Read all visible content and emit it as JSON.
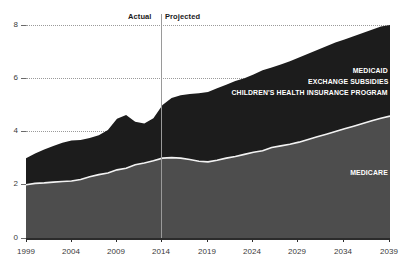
{
  "chart_data": {
    "type": "area",
    "stacked": true,
    "title": "",
    "subtitle": "",
    "xlabel": "",
    "ylabel": "",
    "xlim": [
      1999,
      2039
    ],
    "ylim": [
      0,
      8
    ],
    "grid": true,
    "legend_position": "inline-right",
    "ytick_labels": [
      "0",
      "2",
      "4",
      "6",
      "8"
    ],
    "ytick_values": [
      0,
      2,
      4,
      6,
      8
    ],
    "xtick_labels": [
      "1999",
      "2004",
      "2009",
      "2014",
      "2019",
      "2024",
      "2029",
      "2034",
      "2039"
    ],
    "xtick_values": [
      1999,
      2004,
      2009,
      2014,
      2019,
      2024,
      2029,
      2034,
      2039
    ],
    "annotations": [
      {
        "name": "actual-label",
        "text": "Actual",
        "x": 2013
      },
      {
        "name": "projected-label",
        "text": "Projected",
        "x": 2015
      }
    ],
    "divider_x": 2014,
    "colors": {
      "upper_area": "#1c1c1c",
      "lower_area": "#4d4d4d",
      "separator_line": "#f2f2f2",
      "gridline": "#9a9a9a",
      "axis": "#2b2b2b",
      "label_text": "#ffffff",
      "tick_text": "#3a3a3a",
      "background": "#ffffff",
      "divider_line": "#8e8e8e"
    },
    "x": [
      1999,
      2000,
      2001,
      2002,
      2003,
      2004,
      2005,
      2006,
      2007,
      2008,
      2009,
      2010,
      2011,
      2012,
      2013,
      2014,
      2015,
      2016,
      2017,
      2018,
      2019,
      2020,
      2021,
      2022,
      2023,
      2024,
      2025,
      2026,
      2027,
      2028,
      2029,
      2030,
      2031,
      2032,
      2033,
      2034,
      2035,
      2036,
      2037,
      2038,
      2039
    ],
    "series": [
      {
        "name": "MEDICARE",
        "label": "MEDICARE",
        "color": "#4d4d4d",
        "values": [
          2.0,
          2.05,
          2.07,
          2.1,
          2.12,
          2.14,
          2.2,
          2.3,
          2.38,
          2.44,
          2.56,
          2.62,
          2.75,
          2.82,
          2.9,
          3.0,
          3.02,
          3.0,
          2.95,
          2.88,
          2.86,
          2.92,
          3.0,
          3.06,
          3.14,
          3.22,
          3.28,
          3.4,
          3.46,
          3.52,
          3.6,
          3.7,
          3.8,
          3.9,
          4.0,
          4.1,
          4.2,
          4.3,
          4.4,
          4.5,
          4.58
        ]
      },
      {
        "name": "MEDICAID_EXCHANGE_CHIP",
        "label": "MEDICAID / EXCHANGE SUBSIDIES / CHILDREN'S HEALTH INSURANCE PROGRAM",
        "color": "#1c1c1c",
        "values": [
          1.0,
          1.12,
          1.25,
          1.36,
          1.46,
          1.52,
          1.48,
          1.46,
          1.48,
          1.62,
          1.92,
          2.0,
          1.62,
          1.48,
          1.6,
          2.0,
          2.24,
          2.36,
          2.46,
          2.56,
          2.62,
          2.7,
          2.76,
          2.84,
          2.86,
          2.92,
          3.02,
          3.0,
          3.06,
          3.12,
          3.18,
          3.22,
          3.26,
          3.3,
          3.34,
          3.36,
          3.38,
          3.4,
          3.42,
          3.44,
          3.42
        ]
      }
    ],
    "totals": [
      3.0,
      3.17,
      3.32,
      3.46,
      3.58,
      3.66,
      3.68,
      3.76,
      3.86,
      4.06,
      4.48,
      4.62,
      4.37,
      4.3,
      4.5,
      5.0,
      5.26,
      5.36,
      5.41,
      5.44,
      5.48,
      5.62,
      5.76,
      5.9,
      6.0,
      6.14,
      6.3,
      6.4,
      6.52,
      6.64,
      6.78,
      6.92,
      7.06,
      7.2,
      7.34,
      7.46,
      7.58,
      7.7,
      7.82,
      7.94,
      8.0
    ]
  },
  "series_labels": {
    "upper": [
      "MEDICAID",
      "EXCHANGE SUBSIDIES",
      "CHILDREN'S HEALTH INSURANCE PROGRAM"
    ],
    "lower": [
      "MEDICARE"
    ]
  }
}
